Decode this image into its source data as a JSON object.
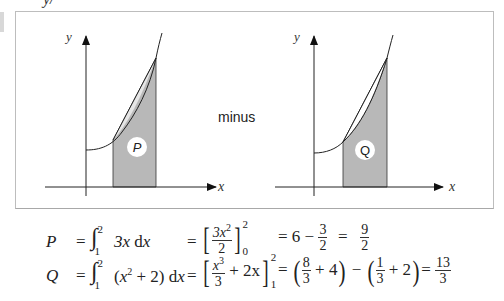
{
  "heading": "y/",
  "between_label": "minus",
  "panels": [
    {
      "id": "left",
      "y_axis_label": "y",
      "x_axis_label": "x",
      "region_label": "P",
      "region_description": "area under chord (straight line 3x) from x=1 to x=2"
    },
    {
      "id": "right",
      "y_axis_label": "y",
      "x_axis_label": "x",
      "region_label": "Q",
      "region_description": "area under curve x^2+2 from x=1 to x=2"
    }
  ],
  "equations": {
    "P": {
      "lhs": "P",
      "eq1": "=",
      "integrand": "3x dx",
      "upper": "2",
      "lower": "1",
      "eq2": "=",
      "antideriv_num": "3x",
      "antideriv_num_exp": "2",
      "antideriv_den": "2",
      "eval_upper": "2",
      "eval_lower": "0",
      "eq3": "= 6 −",
      "step_num": "3",
      "step_den": "2",
      "eq4": "=",
      "result_num": "9",
      "result_den": "2"
    },
    "Q": {
      "lhs": "Q",
      "eq1": "=",
      "integrand_pre": "(x",
      "integrand_exp": "2",
      "integrand_post": " + 2) dx",
      "upper": "2",
      "lower": "1",
      "eq2": "=",
      "anti_num": "x",
      "anti_num_exp": "3",
      "anti_den": "3",
      "anti_rest": "+ 2x",
      "eval_upper": "2",
      "eval_lower": "1",
      "eq3": "=",
      "t1_num": "8",
      "t1_den": "3",
      "t1_rest": "+ 4",
      "minus": "−",
      "t2_num": "1",
      "t2_den": "3",
      "t2_rest": "+ 2",
      "eq4": "=",
      "result_num": "13",
      "result_den": "3"
    }
  },
  "colors": {
    "shade": "#b8b8b8",
    "line": "#222222",
    "frame": "#bdbdbd"
  }
}
